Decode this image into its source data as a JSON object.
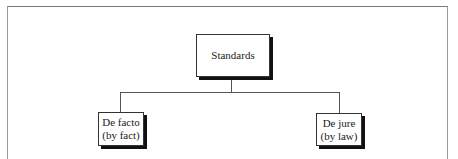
{
  "diagram": {
    "type": "hierarchy",
    "root": {
      "label": "Standards"
    },
    "children": [
      {
        "label": "De facto\n(by fact)"
      },
      {
        "label": "De jure\n(by law)"
      }
    ]
  }
}
